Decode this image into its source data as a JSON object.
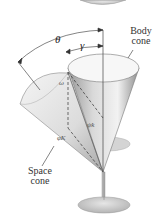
{
  "diagram": {
    "labels": {
      "theta": "θ",
      "gamma": "γ",
      "omega": "ω",
      "psi_k": "ψ̇k",
      "phi_K": "φ̇K",
      "body_cone_line1": "Body",
      "body_cone_line2": "cone",
      "space_cone_line1": "Space",
      "space_cone_line2": "cone"
    },
    "colors": {
      "cone_light": "#e8e8e8",
      "cone_dark": "#9a9a9a",
      "disk": "#c8c8c8",
      "line": "#333333"
    }
  }
}
